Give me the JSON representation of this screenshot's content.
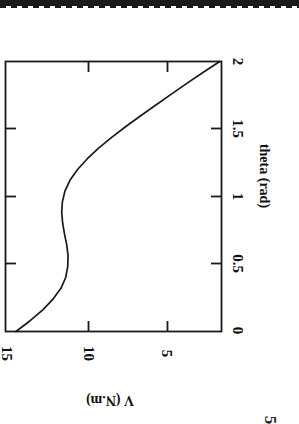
{
  "page": {
    "kind": "scanned-figure",
    "orientation": "rotated-90-clockwise",
    "background": "#ffffff",
    "ink_color": "#1a1a1a"
  },
  "artifacts": {
    "top_scan_bar_label": "",
    "stray_digit": "5"
  },
  "chart_data": {
    "type": "line",
    "title": "",
    "xlabel": "theta (rad)",
    "ylabel": "V (N.m)",
    "xlim": [
      0,
      2
    ],
    "ylim": [
      1.5,
      15.2
    ],
    "xticks": [
      0,
      0.5,
      1,
      1.5,
      2
    ],
    "xtick_labels": [
      "0",
      "0.5",
      "1",
      "1.5",
      "2"
    ],
    "yticks": [
      5,
      10,
      15
    ],
    "ytick_labels": [
      "5",
      "10",
      "15"
    ],
    "grid": false,
    "legend": null,
    "series": [
      {
        "name": "V(theta)",
        "x": [
          0.0,
          0.08,
          0.16,
          0.24,
          0.32,
          0.4,
          0.48,
          0.56,
          0.64,
          0.72,
          0.8,
          0.88,
          0.96,
          1.04,
          1.12,
          1.2,
          1.28,
          1.36,
          1.44,
          1.52,
          1.6,
          1.68,
          1.76,
          1.84,
          1.92,
          2.0
        ],
        "y": [
          14.6,
          13.7,
          12.9,
          12.25,
          11.75,
          11.45,
          11.32,
          11.3,
          11.38,
          11.52,
          11.64,
          11.7,
          11.66,
          11.5,
          11.18,
          10.7,
          10.08,
          9.35,
          8.52,
          7.62,
          6.68,
          5.72,
          4.74,
          3.76,
          2.74,
          1.7
        ]
      }
    ]
  }
}
